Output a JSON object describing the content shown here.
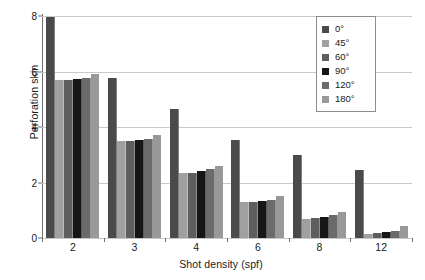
{
  "chart_data": {
    "type": "bar",
    "title": "",
    "xlabel": "Shot density (spf)",
    "ylabel": "Perforation skin",
    "categories": [
      "2",
      "3",
      "4",
      "6",
      "8",
      "12"
    ],
    "ylim": [
      0,
      8
    ],
    "yticks": [
      "0",
      "2",
      "4",
      "6",
      "8"
    ],
    "grid": "horizontal",
    "legend_position": "upper-right",
    "series": [
      {
        "name": "0°",
        "color": "#4a4a4a",
        "values": [
          7.95,
          5.75,
          4.65,
          3.55,
          3.0,
          2.45
        ]
      },
      {
        "name": "45°",
        "color": "#a0a0a0",
        "values": [
          5.7,
          3.5,
          2.35,
          1.3,
          0.7,
          0.15
        ]
      },
      {
        "name": "60°",
        "color": "#5e5e5e",
        "values": [
          5.7,
          3.5,
          2.35,
          1.3,
          0.72,
          0.18
        ]
      },
      {
        "name": "90°",
        "color": "#161616",
        "values": [
          5.72,
          3.52,
          2.4,
          1.33,
          0.75,
          0.22
        ]
      },
      {
        "name": "120°",
        "color": "#6b6b6b",
        "values": [
          5.78,
          3.58,
          2.47,
          1.38,
          0.82,
          0.27
        ]
      },
      {
        "name": "180°",
        "color": "#999999",
        "values": [
          5.9,
          3.7,
          2.6,
          1.5,
          0.92,
          0.45
        ]
      }
    ]
  },
  "legend": {
    "items": [
      {
        "label": "0°"
      },
      {
        "label": "45°"
      },
      {
        "label": "60°"
      },
      {
        "label": "90°"
      },
      {
        "label": "120°"
      },
      {
        "label": "180°"
      }
    ]
  }
}
